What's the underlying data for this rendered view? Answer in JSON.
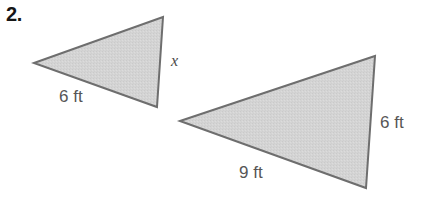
{
  "page": {
    "background_color": "#ffffff",
    "width": 433,
    "height": 203
  },
  "problem": {
    "number_label": "2.",
    "number_color": "#161616"
  },
  "style": {
    "triangle_fill": "#d2d2d2",
    "triangle_stroke": "#6e6e6e",
    "triangle_stroke_width": 2,
    "label_color": "#565656",
    "variable_color": "#4a4a4a"
  },
  "figures": [
    {
      "name": "small-triangle",
      "shape": "triangle",
      "vertices": [
        {
          "x": 34,
          "y": 63
        },
        {
          "x": 163,
          "y": 17
        },
        {
          "x": 157,
          "y": 107
        }
      ],
      "labels": [
        {
          "name": "bottom-side-length",
          "text": "6 ft",
          "type": "dimension"
        },
        {
          "name": "right-side-unknown",
          "text": "x",
          "type": "variable"
        }
      ]
    },
    {
      "name": "large-triangle",
      "shape": "triangle",
      "vertices": [
        {
          "x": 180,
          "y": 121
        },
        {
          "x": 375,
          "y": 56
        },
        {
          "x": 366,
          "y": 188
        }
      ],
      "labels": [
        {
          "name": "bottom-side-length",
          "text": "9 ft",
          "type": "dimension"
        },
        {
          "name": "right-side-length",
          "text": "6 ft",
          "type": "dimension"
        }
      ]
    }
  ],
  "labels": {
    "triangle1_bottom": "6 ft",
    "triangle1_right": "x",
    "triangle2_bottom": "9 ft",
    "triangle2_right": "6 ft"
  }
}
